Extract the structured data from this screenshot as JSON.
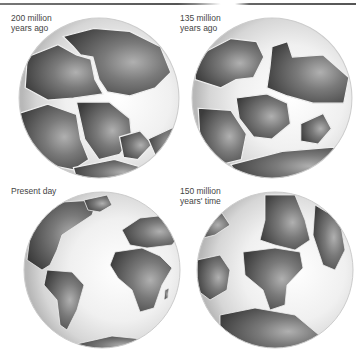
{
  "colors": {
    "land_dark": "#4a4a4a",
    "land_mid": "#8a8a8a",
    "ocean_light": "#f4f4f4",
    "ocean_edge": "#bdbdbd"
  },
  "panels": [
    {
      "id": "200mya",
      "label_line1": "200 million",
      "label_line2": "years ago"
    },
    {
      "id": "135mya",
      "label_line1": "135 million",
      "label_line2": "years ago"
    },
    {
      "id": "present",
      "label_line1": "Present day",
      "label_line2": ""
    },
    {
      "id": "150future",
      "label_line1": "150 million",
      "label_line2": "years' time"
    }
  ]
}
